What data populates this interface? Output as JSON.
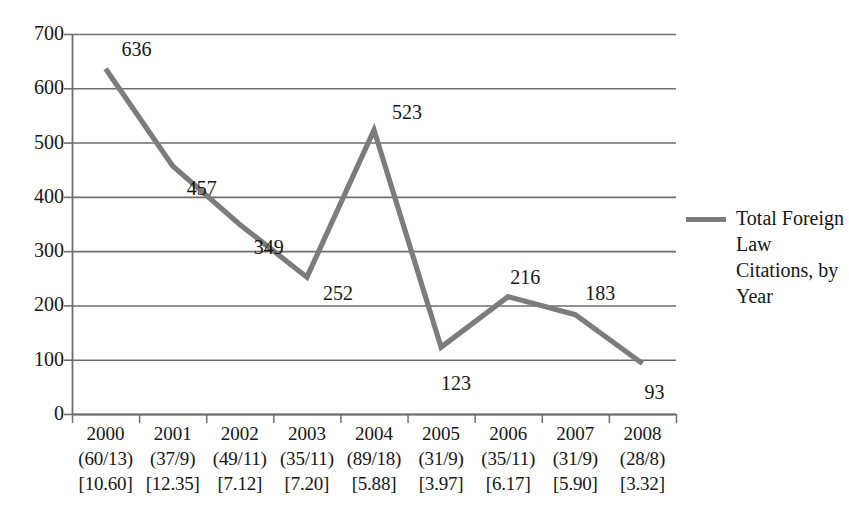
{
  "chart_data": {
    "type": "line",
    "title": "",
    "subtitle": "",
    "xlabel": "",
    "ylabel": "",
    "ylim": [
      0,
      700
    ],
    "ytick_step": 100,
    "grid": true,
    "legend_position": "right",
    "line_color": "#7c7c7c",
    "background_color": "#ffffff",
    "axis_color": "#6e6e6e",
    "text_color": "#161616",
    "categories": [
      "2000",
      "2001",
      "2002",
      "2003",
      "2004",
      "2005",
      "2006",
      "2007",
      "2008"
    ],
    "values": [
      636,
      457,
      349,
      252,
      523,
      123,
      216,
      183,
      93
    ],
    "series": [
      {
        "name": "Total Foreign Law Citations, by Year",
        "values": [
          636,
          457,
          349,
          252,
          523,
          123,
          216,
          183,
          93
        ]
      }
    ],
    "ytick_labels": [
      "700",
      "600",
      "500",
      "400",
      "300",
      "200",
      "100",
      "0"
    ],
    "ytick_values": [
      700,
      600,
      500,
      400,
      300,
      200,
      100,
      0
    ],
    "point_labels": [
      "636",
      "457",
      "349",
      "252",
      "523",
      "123",
      "216",
      "183",
      "93"
    ],
    "x_sublabels_paren": [
      "(60/13)",
      "(37/9)",
      "(49/11)",
      "(35/11)",
      "(89/18)",
      "(31/9)",
      "(35/11)",
      "(31/9)",
      "(28/8)"
    ],
    "x_sublabels_bracket": [
      "[10.60]",
      "[12.35]",
      "[7.12]",
      "[7.20]",
      "[5.88]",
      "[3.97]",
      "[6.17]",
      "[5.90]",
      "[3.32]"
    ]
  },
  "legend": {
    "entries": [
      {
        "label": "Total Foreign Law Citations, by Year",
        "color": "#7c7c7c"
      }
    ]
  },
  "axes": {
    "y": {
      "ticks": [
        {
          "label": "700",
          "value": 700
        },
        {
          "label": "600",
          "value": 600
        },
        {
          "label": "500",
          "value": 500
        },
        {
          "label": "400",
          "value": 400
        },
        {
          "label": "300",
          "value": 300
        },
        {
          "label": "200",
          "value": 200
        },
        {
          "label": "100",
          "value": 100
        },
        {
          "label": "0",
          "value": 0
        }
      ]
    },
    "x": {
      "categories": [
        {
          "year": "2000",
          "paren": "(60/13)",
          "bracket": "[10.60]"
        },
        {
          "year": "2001",
          "paren": "(37/9)",
          "bracket": "[12.35]"
        },
        {
          "year": "2002",
          "paren": "(49/11)",
          "bracket": "[7.12]"
        },
        {
          "year": "2003",
          "paren": "(35/11)",
          "bracket": "[7.20]"
        },
        {
          "year": "2004",
          "paren": "(89/18)",
          "bracket": "[5.88]"
        },
        {
          "year": "2005",
          "paren": "(31/9)",
          "bracket": "[3.97]"
        },
        {
          "year": "2006",
          "paren": "(35/11)",
          "bracket": "[6.17]"
        },
        {
          "year": "2007",
          "paren": "(31/9)",
          "bracket": "[5.90]"
        },
        {
          "year": "2008",
          "paren": "(28/8)",
          "bracket": "[3.32]"
        }
      ]
    }
  },
  "point_label_placement": [
    {
      "value": "636",
      "x": 118,
      "y": 44
    },
    {
      "value": "457",
      "x": 186,
      "y": 152
    },
    {
      "value": "652_unused",
      "x": 0,
      "y": 0
    },
    {
      "value": "349",
      "x": 252,
      "y": 213
    },
    {
      "value": "252",
      "x": 348,
      "y": 272
    },
    {
      "value": "523",
      "x": 414,
      "y": 123
    },
    {
      "value": "123",
      "x": 440,
      "y": 364
    },
    {
      "value": "216",
      "x": 497,
      "y": 264
    },
    {
      "value": "183",
      "x": 572,
      "y": 285
    },
    {
      "value": "93",
      "x": 627,
      "y": 377
    }
  ]
}
